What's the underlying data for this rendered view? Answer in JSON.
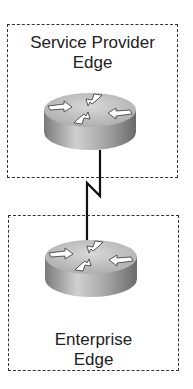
{
  "diagram": {
    "zones": [
      {
        "label_line1": "Service Provider",
        "label_line2": "Edge"
      },
      {
        "label_line1": "Enterprise",
        "label_line2": "Edge"
      }
    ],
    "devices": [
      {
        "type": "router",
        "zone": "Service Provider Edge"
      },
      {
        "type": "router",
        "zone": "Enterprise Edge"
      }
    ],
    "links": [
      {
        "type": "serial",
        "from": "Service Provider Edge router",
        "to": "Enterprise Edge router"
      }
    ],
    "colors": {
      "border": "#333333",
      "text": "#222222",
      "router_top": "#c8c8c8",
      "router_side": "#9a9a9a"
    }
  }
}
